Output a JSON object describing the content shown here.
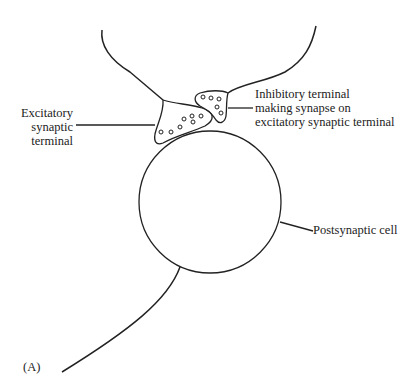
{
  "labels": {
    "excitatory": [
      "Excitatory",
      "synaptic",
      "terminal"
    ],
    "inhibitory": [
      "Inhibitory terminal",
      "making synapse on",
      "excitatory synaptic terminal"
    ],
    "postsynaptic": "Postsynaptic cell",
    "panel": "(A)"
  },
  "colors": {
    "stroke": "#222222",
    "background": "#ffffff"
  }
}
